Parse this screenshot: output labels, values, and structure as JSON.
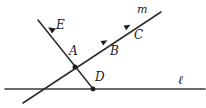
{
  "figure": {
    "kind": "geometry-diagram",
    "width": 206,
    "height": 108,
    "background_color": "#ffffff",
    "ink_color": "#2b2b2b"
  },
  "labels": {
    "point_e": "E",
    "point_a": "A",
    "point_b": "B",
    "point_c": "C",
    "point_d": "D",
    "line_m": "m",
    "line_l": "ℓ"
  },
  "geometry": {
    "line_l": {
      "name": "l",
      "type": "horizontal-line",
      "x1": 5,
      "y1": 89,
      "x2": 205,
      "y2": 89
    },
    "line_m": {
      "name": "m",
      "type": "slanted-line",
      "x1": 23,
      "y1": 103,
      "x2": 161,
      "y2": 12
    },
    "line_ed": {
      "name": "ED",
      "type": "slanted-line",
      "x1": 38,
      "y1": 20,
      "x2": 94,
      "y2": 90
    },
    "points": [
      {
        "id": "A",
        "x": 75,
        "y": 67,
        "kind": "intersection-dot"
      },
      {
        "id": "D",
        "x": 93,
        "y": 89,
        "kind": "dot"
      },
      {
        "id": "E",
        "x": 52,
        "y": 31,
        "kind": "arrow-tick"
      },
      {
        "id": "B",
        "x": 105,
        "y": 42,
        "kind": "arrow-tick"
      },
      {
        "id": "C",
        "x": 128,
        "y": 27,
        "kind": "arrow-tick"
      }
    ]
  },
  "label_positions": {
    "point_e": {
      "x": 56,
      "y": 19
    },
    "point_a": {
      "x": 69,
      "y": 45
    },
    "point_b": {
      "x": 110,
      "y": 45
    },
    "point_c": {
      "x": 134,
      "y": 29
    },
    "point_d": {
      "x": 95,
      "y": 71
    },
    "line_m": {
      "x": 137,
      "y": 4
    },
    "line_l": {
      "x": 178,
      "y": 74
    }
  }
}
